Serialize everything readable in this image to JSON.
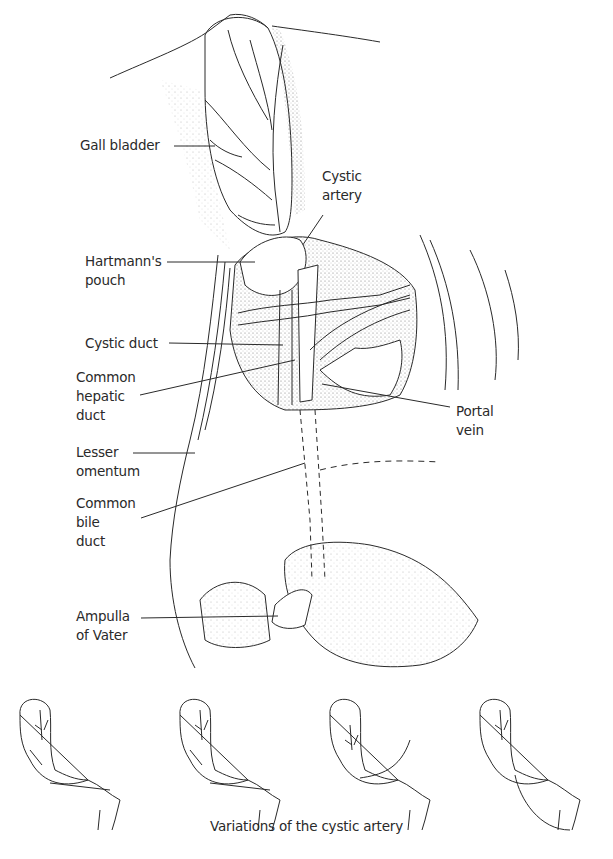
{
  "figure": {
    "labels": {
      "gall_bladder": "Gall bladder",
      "cystic_artery": "Cystic\nartery",
      "hartmanns_pouch": "Hartmann's\npouch",
      "cystic_duct": "Cystic duct",
      "common_hepatic_duct": "Common\nhepatic\nduct",
      "portal_vein": "Portal\nvein",
      "lesser_omentum": "Lesser\nomentum",
      "common_bile_duct": "Common\nbile\nduct",
      "ampulla_of_vater": "Ampulla\nof Vater"
    },
    "variations": {
      "caption": "Variations of the cystic artery",
      "count": 4
    },
    "colors": {
      "ink": "#2a2a2a",
      "background": "#ffffff",
      "stipple": "#888888"
    }
  }
}
